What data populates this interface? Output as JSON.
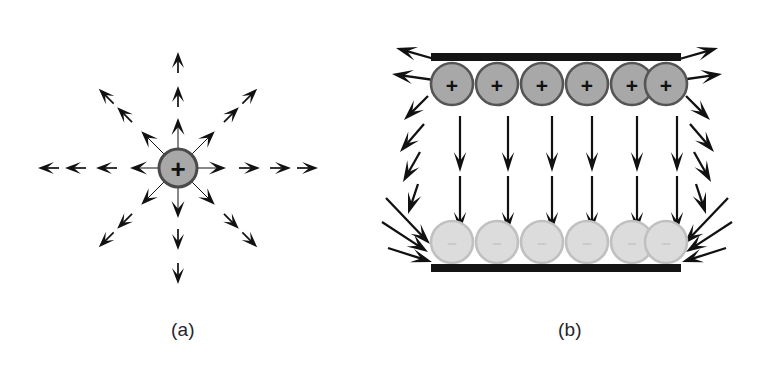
{
  "figure": {
    "background_color": "#ffffff",
    "ink_color": "#111111",
    "width": 764,
    "height": 366
  },
  "panels": [
    {
      "id": "a",
      "caption": "(a)",
      "caption_x": 183,
      "caption_y": 336,
      "subject": "point-charge-radial-field",
      "charge": {
        "sign": "+",
        "label": "+",
        "cx": 178,
        "cy": 168,
        "rx": 19,
        "ry": 19,
        "fill": "#a8a8a8",
        "stroke": "#4a4a4a",
        "stroke_width": 3,
        "sign_font_size": 26
      },
      "field_rays": [
        {
          "name": "ray-up",
          "angle_deg": -90,
          "start_r": 20,
          "arrowheads": [
            50,
            82,
            116
          ]
        },
        {
          "name": "ray-up-right",
          "angle_deg": -45,
          "start_r": 20,
          "arrowheads": [
            52,
            86,
            112
          ]
        },
        {
          "name": "ray-right",
          "angle_deg": 0,
          "start_r": 20,
          "arrowheads": [
            48,
            82,
            113,
            140
          ]
        },
        {
          "name": "ray-down-right",
          "angle_deg": 45,
          "start_r": 20,
          "arrowheads": [
            52,
            86,
            112
          ]
        },
        {
          "name": "ray-down",
          "angle_deg": 90,
          "start_r": 20,
          "arrowheads": [
            50,
            82,
            116
          ]
        },
        {
          "name": "ray-down-left",
          "angle_deg": 135,
          "start_r": 20,
          "arrowheads": [
            52,
            86,
            112
          ]
        },
        {
          "name": "ray-left",
          "angle_deg": 180,
          "start_r": 20,
          "arrowheads": [
            48,
            82,
            113,
            140
          ]
        },
        {
          "name": "ray-up-left",
          "angle_deg": -135,
          "start_r": 20,
          "arrowheads": [
            52,
            86,
            112
          ]
        }
      ]
    },
    {
      "id": "b",
      "caption": "(b)",
      "caption_x": 570,
      "caption_y": 336,
      "subject": "parallel-plate-capacitor-field",
      "plates": [
        {
          "name": "top-plate",
          "polarity": "positive",
          "bar": {
            "x": 431,
            "y": 53,
            "width": 250,
            "height": 8,
            "fill": "#141414"
          },
          "charge_sign": "+",
          "charge_fill": "#a8a8a8",
          "charge_stroke": "#555555",
          "charge_sign_color": "#111111",
          "charge_sign_font_size": 21,
          "charge_row_cy": 84,
          "charge_rx": 21,
          "charge_ry": 21,
          "charge_cx": [
            452,
            497,
            542,
            587,
            632,
            666
          ]
        },
        {
          "name": "bottom-plate",
          "polarity": "negative",
          "bar": {
            "x": 431,
            "y": 264,
            "width": 250,
            "height": 8,
            "fill": "#141414"
          },
          "charge_sign": "–",
          "charge_fill": "#dcdcdc",
          "charge_stroke": "#c0c0c0",
          "charge_sign_color": "#c9c9c9",
          "charge_sign_font_size": 17,
          "charge_row_cy": 242,
          "charge_rx": 21,
          "charge_ry": 21,
          "charge_cx": [
            452,
            497,
            542,
            587,
            632,
            666
          ]
        }
      ],
      "interior_field": {
        "name": "uniform-downward-field",
        "direction": "down",
        "column_x": [
          460,
          508,
          552,
          592,
          637,
          677
        ],
        "segments": [
          {
            "y_start": 116,
            "y_end": 172
          },
          {
            "y_start": 176,
            "y_end": 232
          }
        ]
      },
      "fringe_field": {
        "name": "fringing-field",
        "left": {
          "top_horizontal": [
            {
              "x1": 438,
              "y1": 60,
              "x2": 396,
              "y2": 48
            },
            {
              "x1": 434,
              "y1": 80,
              "x2": 392,
              "y2": 74
            }
          ],
          "curve": [
            {
              "x1": 428,
              "y1": 96,
              "x2": 404,
              "y2": 120
            },
            {
              "x1": 424,
              "y1": 124,
              "x2": 400,
              "y2": 152
            },
            {
              "x1": 420,
              "y1": 152,
              "x2": 403,
              "y2": 182
            },
            {
              "x1": 418,
              "y1": 184,
              "x2": 408,
              "y2": 214
            }
          ],
          "bottom_converging": [
            {
              "x1": 386,
              "y1": 198,
              "x2": 430,
              "y2": 244
            },
            {
              "x1": 382,
              "y1": 222,
              "x2": 428,
              "y2": 252
            },
            {
              "x1": 388,
              "y1": 248,
              "x2": 432,
              "y2": 262
            }
          ]
        },
        "right": {
          "top_horizontal": [
            {
              "x1": 676,
              "y1": 60,
              "x2": 718,
              "y2": 48
            },
            {
              "x1": 680,
              "y1": 80,
              "x2": 722,
              "y2": 74
            }
          ],
          "curve": [
            {
              "x1": 686,
              "y1": 96,
              "x2": 710,
              "y2": 120
            },
            {
              "x1": 690,
              "y1": 124,
              "x2": 714,
              "y2": 152
            },
            {
              "x1": 694,
              "y1": 152,
              "x2": 711,
              "y2": 182
            },
            {
              "x1": 696,
              "y1": 184,
              "x2": 706,
              "y2": 214
            }
          ],
          "bottom_converging": [
            {
              "x1": 728,
              "y1": 198,
              "x2": 684,
              "y2": 244
            },
            {
              "x1": 732,
              "y1": 222,
              "x2": 686,
              "y2": 252
            },
            {
              "x1": 726,
              "y1": 248,
              "x2": 682,
              "y2": 262
            }
          ]
        }
      }
    }
  ]
}
